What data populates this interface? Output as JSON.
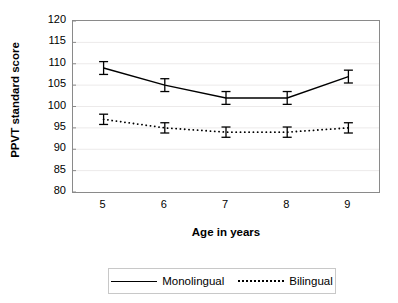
{
  "chart_data": {
    "type": "line",
    "title": "",
    "xlabel": "Age in years",
    "ylabel": "PPVT standard score",
    "x": [
      5,
      6,
      7,
      8,
      9
    ],
    "categories": [
      "5",
      "6",
      "7",
      "8",
      "9"
    ],
    "xtick_labels": [
      "5",
      "6",
      "7",
      "8",
      "9"
    ],
    "ytick_labels": [
      "120",
      "115",
      "110",
      "105",
      "100",
      "95",
      "90",
      "85",
      "80"
    ],
    "ytick_values": [
      120,
      115,
      110,
      105,
      100,
      95,
      90,
      85,
      80
    ],
    "ylim": [
      80,
      120
    ],
    "xlim": [
      4.5,
      9.5
    ],
    "grid": "horizontal",
    "legend_position": "bottom",
    "series": [
      {
        "name": "Monolingual",
        "style": "solid",
        "color": "#000000",
        "values": [
          109,
          105,
          102,
          102,
          107
        ],
        "errors": [
          1.5,
          1.5,
          1.5,
          1.5,
          1.5
        ]
      },
      {
        "name": "Bilingual",
        "style": "dotted",
        "color": "#000000",
        "values": [
          97,
          95,
          94,
          94,
          95
        ],
        "errors": [
          1.2,
          1.2,
          1.2,
          1.2,
          1.2
        ]
      }
    ]
  },
  "axes": {
    "ylabel": "PPVT standard score",
    "xlabel": "Age in years"
  },
  "legend": {
    "items": [
      {
        "label": "Monolingual",
        "style": "solid"
      },
      {
        "label": "Bilingual",
        "style": "dotted"
      }
    ]
  }
}
